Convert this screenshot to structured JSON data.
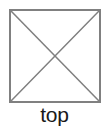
{
  "figure": {
    "name": "orthographic-view-indicator",
    "label": "top",
    "background_color": "#ffffff"
  },
  "glyph": {
    "shape": "square-with-crossed-diagonals",
    "stroke_color": "#808080",
    "fill_color": "#ffffff",
    "stroke_width": 1.5,
    "square": {
      "x": 10,
      "y": 10,
      "width": 90,
      "height": 92
    },
    "diagonals": [
      {
        "name": "diagonal-top-left-to-bottom-right",
        "x1": 10,
        "y1": 10,
        "x2": 100,
        "y2": 102
      },
      {
        "name": "diagonal-top-right-to-bottom-left",
        "x1": 100,
        "y1": 10,
        "x2": 10,
        "y2": 102
      }
    ]
  },
  "label": {
    "text": "top",
    "color": "#1a1a1a",
    "font_size": 21
  }
}
